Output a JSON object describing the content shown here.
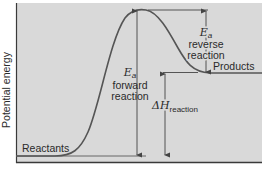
{
  "diagram": {
    "type": "reaction-energy-profile",
    "y_axis_label": "Potential energy",
    "colors": {
      "panel": "#d9d9d9",
      "line": "#555555",
      "axis": "#3a3a3a",
      "text": "#2a2a2a"
    },
    "labels": {
      "reactants": "Reactants",
      "products": "Products",
      "ea_symbol_forward": "E",
      "ea_sub_forward": "a",
      "ea_forward_line1": "forward",
      "ea_forward_line2": "reaction",
      "ea_symbol_reverse": "E",
      "ea_sub_reverse": "a",
      "ea_reverse_line1": "reverse",
      "ea_reverse_line2": "reaction",
      "dh_symbol": "ΔH",
      "dh_sub": "reaction"
    },
    "levels": {
      "reactants_y": 156,
      "peak_y": 10,
      "products_y": 73
    }
  }
}
